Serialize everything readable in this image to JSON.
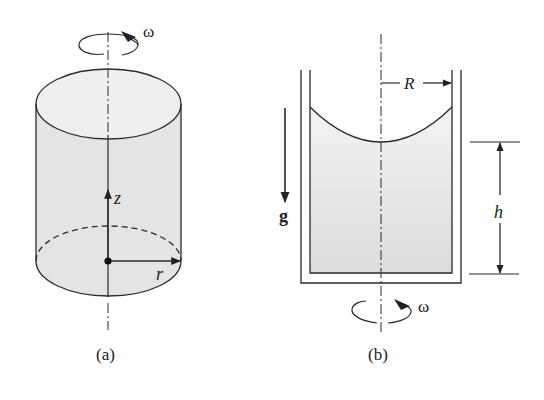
{
  "figure": {
    "panel_a": {
      "caption": "(a)",
      "omega_label": "ω",
      "z_label": "z",
      "r_label": "r"
    },
    "panel_b": {
      "caption": "(b)",
      "omega_label": "ω",
      "R_label": "R",
      "h_label": "h",
      "g_label": "g"
    },
    "colors": {
      "stroke": "#2a2a2a",
      "fill": "#e6e6e6",
      "fill_light": "#f0f0f0",
      "background": "#ffffff"
    }
  }
}
